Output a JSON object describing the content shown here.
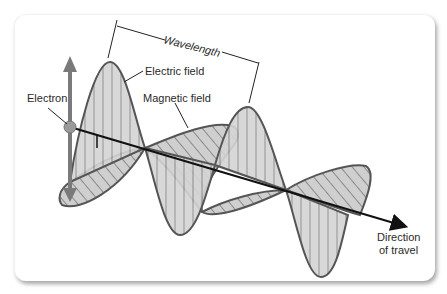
{
  "diagram": {
    "labels": {
      "wavelength": "Wavelength",
      "electric_field": "Electric field",
      "magnetic_field": "Magnetic field",
      "electron": "Electron",
      "direction_line1": "Direction",
      "direction_line2": "of travel"
    },
    "colors": {
      "fill": "#cfcfcf",
      "outline": "#555555",
      "hatch": "#8a8a8a",
      "axis": "#111111",
      "electron_arrow": "#7a7a7a"
    }
  }
}
